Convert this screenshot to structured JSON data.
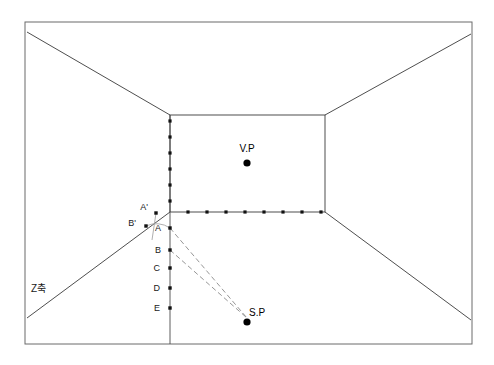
{
  "diagram": {
    "canvas": {
      "width": 494,
      "height": 365,
      "background": "#ffffff"
    },
    "frame": {
      "name": "picture-plane-frame",
      "x": 25,
      "y": 22,
      "width": 447,
      "height": 322,
      "stroke": "#6b6b6b"
    },
    "back_wall": {
      "name": "back-wall-rectangle",
      "left": 170,
      "top": 115,
      "right": 325,
      "bottom": 212,
      "stroke": "#3a3a3a"
    },
    "vanishing_point": {
      "label": "V.P",
      "x": 247,
      "y": 163,
      "label_x": 247,
      "label_y": 152,
      "radius": 3.6,
      "color": "#000000"
    },
    "station_point": {
      "label": "S.P",
      "x": 247,
      "y": 322,
      "label_x": 249,
      "label_y": 316,
      "radius": 3.6,
      "color": "#000000"
    },
    "axis_annotation": {
      "label": "Z축",
      "x": 31,
      "y": 292
    },
    "ground_line_points": {
      "name": "ground-line-measure-points",
      "y": 212,
      "x_start": 170,
      "x_end": 325,
      "count": 8,
      "values": [
        188,
        207,
        226,
        245,
        264,
        283,
        302,
        321
      ]
    },
    "vertical_line_points": {
      "name": "vertical-measure-points",
      "x": 170,
      "y_start": 115,
      "y_end": 212,
      "count": 6,
      "values": [
        121,
        137,
        153,
        169,
        185,
        201
      ]
    },
    "measuring_points": [
      {
        "label": "A'",
        "x": 156,
        "y": 213,
        "label_x": 148,
        "label_y": 210,
        "on": "left-diagonal"
      },
      {
        "label": "B'",
        "x": 146,
        "y": 226,
        "label_x": 136,
        "label_y": 226,
        "on": "left-diagonal"
      },
      {
        "label": "A",
        "x": 170,
        "y": 228,
        "label_x": 161,
        "label_y": 231,
        "on": "vertical"
      },
      {
        "label": "B",
        "x": 170,
        "y": 250,
        "label_x": 161,
        "label_y": 253,
        "on": "vertical"
      },
      {
        "label": "C",
        "x": 170,
        "y": 268,
        "label_x": 160,
        "label_y": 271,
        "on": "vertical"
      },
      {
        "label": "D",
        "x": 170,
        "y": 288,
        "label_x": 160,
        "label_y": 291,
        "on": "vertical"
      },
      {
        "label": "E",
        "x": 170,
        "y": 308,
        "label_x": 160,
        "label_y": 311,
        "on": "vertical"
      }
    ],
    "sight_rays": [
      {
        "name": "ray-A-to-SP",
        "from": [
          170,
          228
        ],
        "to": [
          247,
          318
        ]
      },
      {
        "name": "ray-B-to-SP",
        "from": [
          170,
          250
        ],
        "to": [
          247,
          318
        ]
      }
    ],
    "room_edges": [
      {
        "name": "edge-top-left",
        "from": [
          27,
          32
        ],
        "to": [
          170,
          115
        ]
      },
      {
        "name": "edge-top-right",
        "from": [
          471,
          34
        ],
        "to": [
          325,
          115
        ]
      },
      {
        "name": "edge-bottom-left",
        "from": [
          27,
          318
        ],
        "to": [
          170,
          212
        ]
      },
      {
        "name": "edge-bottom-right",
        "from": [
          471,
          320
        ],
        "to": [
          325,
          212
        ]
      }
    ],
    "vertical_guide": {
      "name": "picture-plane-vertical",
      "x": 170,
      "y_top": 115,
      "y_bottom": 344
    },
    "colors": {
      "frame": "#6b6b6b",
      "room": "#3a3a3a",
      "dot": "#111111",
      "ray": "#8a8a8a",
      "text": "#1a1a1a"
    }
  }
}
